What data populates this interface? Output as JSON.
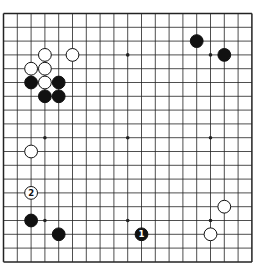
{
  "board": {
    "size": 19,
    "star_points": [
      [
        3,
        3
      ],
      [
        9,
        3
      ],
      [
        15,
        3
      ],
      [
        3,
        9
      ],
      [
        9,
        9
      ],
      [
        15,
        9
      ],
      [
        3,
        15
      ],
      [
        9,
        15
      ],
      [
        15,
        15
      ]
    ],
    "stones": [
      {
        "color": "white",
        "col": 3,
        "row": 3
      },
      {
        "color": "white",
        "col": 5,
        "row": 3
      },
      {
        "color": "white",
        "col": 2,
        "row": 4
      },
      {
        "color": "white",
        "col": 3,
        "row": 4
      },
      {
        "color": "black",
        "col": 2,
        "row": 5
      },
      {
        "color": "white",
        "col": 3,
        "row": 5
      },
      {
        "color": "black",
        "col": 4,
        "row": 5
      },
      {
        "color": "black",
        "col": 3,
        "row": 6
      },
      {
        "color": "black",
        "col": 4,
        "row": 6
      },
      {
        "color": "black",
        "col": 14,
        "row": 2
      },
      {
        "color": "black",
        "col": 16,
        "row": 3
      },
      {
        "color": "white",
        "col": 2,
        "row": 10
      },
      {
        "color": "white",
        "col": 2,
        "row": 13,
        "label": "2"
      },
      {
        "color": "black",
        "col": 2,
        "row": 15
      },
      {
        "color": "black",
        "col": 4,
        "row": 16
      },
      {
        "color": "black",
        "col": 10,
        "row": 16,
        "label": "1"
      },
      {
        "color": "white",
        "col": 16,
        "row": 14
      },
      {
        "color": "white",
        "col": 15,
        "row": 16
      }
    ]
  },
  "caption": ""
}
